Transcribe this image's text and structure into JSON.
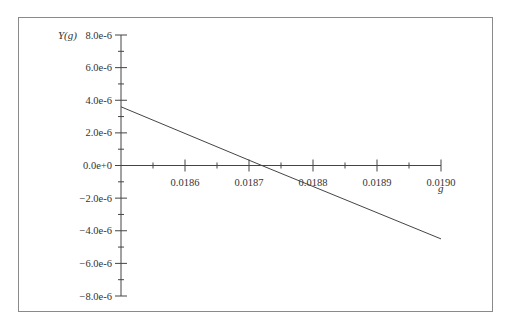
{
  "chart_data": {
    "type": "line",
    "title": "",
    "xlabel": "g",
    "ylabel": "Y(g)",
    "xlim": [
      0.0185,
      0.019
    ],
    "ylim": [
      -8e-06,
      8e-06
    ],
    "x_ticks": [
      "0.0186",
      "0.0187",
      "0.0188",
      "0.0189",
      "0.0190"
    ],
    "y_ticks": [
      "8.0e-6",
      "6.0e-6",
      "4.0e-6",
      "2.0e-6",
      "0.0e+0",
      "−2.0e-6",
      "−4.0e-6",
      "−6.0e-6",
      "−8.0e-6"
    ],
    "grid": false,
    "legend": null,
    "series": [
      {
        "name": "Y(g)",
        "x": [
          0.0185,
          0.01872,
          0.019
        ],
        "y": [
          3.6e-06,
          0.0,
          -4.5e-06
        ]
      }
    ]
  }
}
